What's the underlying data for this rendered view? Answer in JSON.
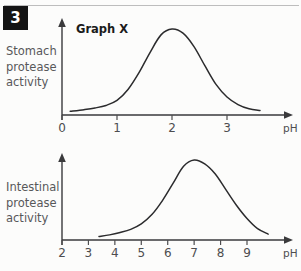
{
  "question_number": "3",
  "labels": {
    "stomach": "Stomach\nprotease\nactivity",
    "intestinal": "Intestinal\nprotease\nactivity"
  },
  "colors": {
    "badge_bg": "#141414",
    "badge_text": "#ffffff",
    "curve": "#2b2b2d",
    "axis": "#3a3a3c",
    "label_text": "#58585a",
    "rule": "#bdbdbd",
    "background": "#fcfcfb"
  },
  "chart_data": [
    {
      "type": "line",
      "title": "Graph X",
      "xlabel": "pH",
      "ylabel": "Stomach protease activity",
      "xlim": [
        0,
        3.7
      ],
      "ylim": [
        0,
        1
      ],
      "xticks": [
        "0",
        "1",
        "2",
        "3"
      ],
      "xtick_values": [
        0,
        1,
        2,
        3
      ],
      "yticks": [],
      "grid": false,
      "legend": "none",
      "annotation": "Bell-shaped curve peaking at pH 2",
      "x": [
        0.15,
        0.4,
        0.6,
        0.8,
        1.0,
        1.2,
        1.4,
        1.6,
        1.8,
        2.0,
        2.2,
        2.4,
        2.6,
        2.8,
        3.0,
        3.2,
        3.4,
        3.6
      ],
      "values": [
        0.02,
        0.04,
        0.06,
        0.09,
        0.15,
        0.28,
        0.48,
        0.72,
        0.93,
        1.0,
        0.95,
        0.79,
        0.56,
        0.34,
        0.19,
        0.1,
        0.05,
        0.03
      ]
    },
    {
      "type": "line",
      "title": "Graph Y",
      "xlabel": "pH",
      "ylabel": "Intestinal protease activity",
      "xlim": [
        2,
        10
      ],
      "ylim": [
        0,
        1
      ],
      "xticks": [
        "2",
        "3",
        "4",
        "5",
        "6",
        "7",
        "8",
        "9"
      ],
      "xtick_values": [
        2,
        3,
        4,
        5,
        6,
        7,
        8,
        9
      ],
      "yticks": [],
      "grid": false,
      "legend": "none",
      "annotation": "Bell-shaped curve peaking at pH 7",
      "x": [
        3.4,
        3.8,
        4.2,
        4.6,
        5.0,
        5.4,
        5.8,
        6.2,
        6.6,
        7.0,
        7.4,
        7.8,
        8.2,
        8.6,
        9.0,
        9.4,
        9.8
      ],
      "values": [
        0.02,
        0.04,
        0.07,
        0.11,
        0.18,
        0.3,
        0.48,
        0.7,
        0.92,
        1.0,
        0.95,
        0.82,
        0.62,
        0.42,
        0.25,
        0.12,
        0.05
      ]
    }
  ]
}
